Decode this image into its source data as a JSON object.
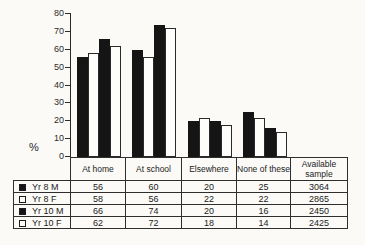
{
  "chart_data": {
    "type": "bar",
    "title": "",
    "xlabel": "",
    "ylabel": "%",
    "ylim": [
      0,
      80
    ],
    "ytick_step": 10,
    "grid": false,
    "legend_position": "table-left-column",
    "categories": [
      "At home",
      "At school",
      "Elsewhere",
      "None of these"
    ],
    "series": [
      {
        "name": "Yr 8 M",
        "fill": "black",
        "values": [
          56,
          60,
          20,
          25
        ]
      },
      {
        "name": "Yr 8 F",
        "fill": "white",
        "values": [
          58,
          56,
          22,
          22
        ]
      },
      {
        "name": "Yr 10 M",
        "fill": "black",
        "values": [
          66,
          74,
          20,
          16
        ]
      },
      {
        "name": "Yr 10 F",
        "fill": "white",
        "values": [
          62,
          72,
          18,
          14
        ]
      }
    ]
  },
  "table": {
    "column_headers": [
      "At home",
      "At school",
      "Elsewhere",
      "None of these",
      "Available sample"
    ],
    "rows": [
      {
        "label": "Yr 8 M",
        "marker": "black",
        "values": [
          "56",
          "60",
          "20",
          "25",
          "3064"
        ]
      },
      {
        "label": "Yr 8 F",
        "marker": "white",
        "values": [
          "58",
          "56",
          "22",
          "22",
          "2865"
        ]
      },
      {
        "label": "Yr 10 M",
        "marker": "black",
        "values": [
          "66",
          "74",
          "20",
          "16",
          "2450"
        ]
      },
      {
        "label": "Yr 10 F",
        "marker": "white",
        "values": [
          "62",
          "72",
          "18",
          "14",
          "2425"
        ]
      }
    ]
  },
  "colors": {
    "background": "#fbfaf7",
    "bar_black": "#151515",
    "bar_white": "#fdfdfc",
    "line": "#2b2b2b",
    "text": "#262626"
  }
}
